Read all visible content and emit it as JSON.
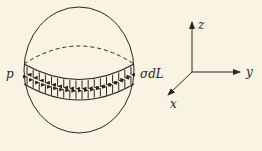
{
  "figure": {
    "sphere": {
      "center": [
        79,
        70
      ],
      "rx": 55,
      "ry": 63,
      "equator_dashed": true
    },
    "band": {
      "arrow_pairs": 18,
      "label_left": "p",
      "label_right": "σdL"
    },
    "axes": {
      "origin": [
        196,
        72
      ],
      "z_label": "z",
      "y_label": "y",
      "x_label": "x"
    },
    "colors": {
      "background": "#f8f3e3",
      "ink": "#2a2520"
    }
  }
}
